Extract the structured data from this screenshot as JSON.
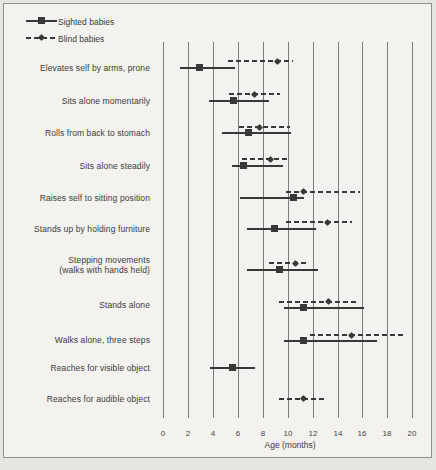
{
  "colors": {
    "ink": "#383838",
    "grid": "#7d7d7a",
    "text": "#3b3b3b",
    "paper": "#f3f2ee",
    "outer_paper": "#e8e6e1",
    "border": "#8f8f8d"
  },
  "chart_data": {
    "type": "range-dot",
    "title": "",
    "xlabel": "Age (months)",
    "xlim": [
      0,
      20
    ],
    "x_ticks": [
      "0",
      "2",
      "4",
      "6",
      "8",
      "10",
      "12",
      "14",
      "16",
      "18",
      "20"
    ],
    "x_tick_values": [
      0,
      2,
      4,
      6,
      8,
      10,
      12,
      14,
      16,
      18,
      20
    ],
    "grid": "vertical-only",
    "legend_position": "top-left",
    "legend": [
      {
        "label": "Sighted babies",
        "series": "sighted",
        "line": "solid",
        "marker": "square"
      },
      {
        "label": "Blind babies",
        "series": "blind",
        "line": "dashed",
        "marker": "diamond"
      }
    ],
    "rows": [
      {
        "label": "Elevates self by arms, prone",
        "sighted": {
          "from": 1.4,
          "value": 3.0,
          "to": 5.8
        },
        "blind": {
          "from": 5.2,
          "value": 9.2,
          "to": 10.4
        }
      },
      {
        "label": "Sits alone momentarily",
        "sighted": {
          "from": 3.7,
          "value": 5.7,
          "to": 8.5
        },
        "blind": {
          "from": 5.3,
          "value": 7.4,
          "to": 9.4
        }
      },
      {
        "label": "Rolls from back to stomach",
        "sighted": {
          "from": 4.7,
          "value": 6.9,
          "to": 10.3
        },
        "blind": {
          "from": 6.1,
          "value": 7.8,
          "to": 10.2
        }
      },
      {
        "label": "Sits alone steadily",
        "sighted": {
          "from": 5.5,
          "value": 6.5,
          "to": 9.6
        },
        "blind": {
          "from": 6.3,
          "value": 8.7,
          "to": 10.2
        }
      },
      {
        "label": "Raises self to sitting position",
        "sighted": {
          "from": 6.2,
          "value": 10.5,
          "to": 11.3
        },
        "blind": {
          "from": 9.9,
          "value": 11.3,
          "to": 15.8
        }
      },
      {
        "label": "Stands up by holding furniture",
        "sighted": {
          "from": 6.7,
          "value": 9.0,
          "to": 12.3
        },
        "blind": {
          "from": 9.9,
          "value": 13.2,
          "to": 15.2
        }
      },
      {
        "label": "Stepping movements",
        "label2": "(walks with hands held)",
        "sighted": {
          "from": 6.7,
          "value": 9.4,
          "to": 12.4
        },
        "blind": {
          "from": 8.5,
          "value": 10.7,
          "to": 11.7
        }
      },
      {
        "label": "Stands alone",
        "sighted": {
          "from": 9.7,
          "value": 11.3,
          "to": 16.1
        },
        "blind": {
          "from": 9.3,
          "value": 13.3,
          "to": 15.6
        }
      },
      {
        "label": "Walks alone, three steps",
        "sighted": {
          "from": 9.7,
          "value": 11.3,
          "to": 17.2
        },
        "blind": {
          "from": 11.8,
          "value": 15.2,
          "to": 19.3
        }
      },
      {
        "label": "Reaches for visible object",
        "sighted": {
          "from": 3.8,
          "value": 5.6,
          "to": 7.4
        },
        "blind": null
      },
      {
        "label": "Reaches for audible object",
        "sighted": null,
        "blind": {
          "from": 9.3,
          "value": 11.3,
          "to": 13.1
        }
      }
    ]
  }
}
